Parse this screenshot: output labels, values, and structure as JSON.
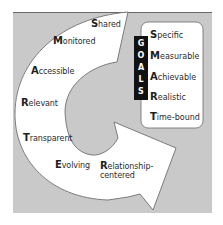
{
  "diagram": {
    "type": "cycle-arrow-with-acronym-box",
    "colors": {
      "panel_background": "#c9c9c9",
      "panel_top_border": "#6a6a6a",
      "arrow_fill": "#ffffff",
      "arrow_stroke": "#6f6f6f",
      "goals_bar": "#111111",
      "goals_bar_text": "#ffffff",
      "box_fill": "#ffffff",
      "box_stroke": "#777777",
      "text": "#2b2b2b"
    },
    "cycle_labels": [
      {
        "initial": "S",
        "rest": "hared"
      },
      {
        "initial": "M",
        "rest": "onitored"
      },
      {
        "initial": "A",
        "rest": "ccessible"
      },
      {
        "initial": "R",
        "rest": "elevant"
      },
      {
        "initial": "T",
        "rest": "ransparent"
      },
      {
        "initial": "E",
        "rest": "volving"
      },
      {
        "initial": "R",
        "rest": "elationship-",
        "line2": "centered"
      }
    ],
    "goals_bar": {
      "letters": [
        "G",
        "O",
        "A",
        "L",
        "S"
      ]
    },
    "goals_box": {
      "items": [
        {
          "initial": "S",
          "rest": "pecific"
        },
        {
          "initial": "M",
          "rest": "easurable"
        },
        {
          "initial": "A",
          "rest": "chievable"
        },
        {
          "initial": "R",
          "rest": "ealistic"
        },
        {
          "initial": "T",
          "rest": "ime-bound"
        }
      ]
    }
  }
}
